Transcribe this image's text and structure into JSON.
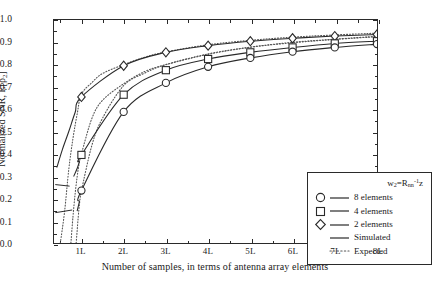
{
  "chart_data": {
    "type": "line",
    "title": "",
    "xlabel": "Number of samples, in terms of antenna array elements",
    "ylabel": "Normalized SNR, E[ρ₂]",
    "xlim": [
      0.35,
      8.0
    ],
    "ylim": [
      0.0,
      1.0
    ],
    "grid": false,
    "legend_position": "bottom-right",
    "x_tick_labels": [
      "1L",
      "2L",
      "3L",
      "4L",
      "5L",
      "6L",
      "7L",
      "8L"
    ],
    "x_tick_values": [
      1,
      2,
      3,
      4,
      5,
      6,
      7,
      8
    ],
    "y_tick_labels": [
      "0.0",
      "0.1",
      "0.2",
      "0.3",
      "0.4",
      "0.5",
      "0.6",
      "0.7",
      "0.8",
      "0.9",
      "1.0"
    ],
    "y_tick_values": [
      0.0,
      0.1,
      0.2,
      0.3,
      0.4,
      0.5,
      0.6,
      0.7,
      0.8,
      0.9,
      1.0
    ],
    "x": [
      1,
      2,
      3,
      4,
      5,
      6,
      7,
      8
    ],
    "series": [
      {
        "name": "2 elements",
        "marker": "diamond",
        "linestyle": "solid",
        "values": [
          0.655,
          0.795,
          0.855,
          0.885,
          0.905,
          0.918,
          0.928,
          0.935
        ]
      },
      {
        "name": "4 elements",
        "marker": "square",
        "linestyle": "solid",
        "values": [
          0.395,
          0.665,
          0.775,
          0.825,
          0.855,
          0.877,
          0.895,
          0.905
        ]
      },
      {
        "name": "8 elements",
        "marker": "circle",
        "linestyle": "solid",
        "values": [
          0.235,
          0.588,
          0.718,
          0.79,
          0.83,
          0.858,
          0.877,
          0.892
        ]
      }
    ],
    "expected_series": [
      {
        "name": "2 elements expected",
        "linestyle": "dotted",
        "x": [
          0.5,
          0.6,
          0.7,
          0.8,
          0.9,
          1.0,
          1.25,
          1.5,
          2.0,
          2.5,
          3.0,
          4.0,
          5.0,
          6.0,
          7.0,
          8.0
        ],
        "values": [
          0.0,
          0.14,
          0.33,
          0.47,
          0.58,
          0.667,
          0.72,
          0.76,
          0.8,
          0.833,
          0.857,
          0.889,
          0.909,
          0.923,
          0.933,
          0.941
        ]
      },
      {
        "name": "4 elements expected",
        "linestyle": "dotted",
        "x": [
          0.75,
          0.8,
          0.85,
          0.9,
          0.95,
          1.0,
          1.25,
          1.5,
          2.0,
          2.5,
          3.0,
          4.0,
          5.0,
          6.0,
          7.0,
          8.0
        ],
        "values": [
          0.0,
          0.12,
          0.22,
          0.3,
          0.36,
          0.4,
          0.56,
          0.64,
          0.714,
          0.769,
          0.8,
          0.846,
          0.878,
          0.9,
          0.914,
          0.927
        ]
      },
      {
        "name": "8 elements expected",
        "linestyle": "dotted",
        "x": [
          0.875,
          0.9,
          0.925,
          0.95,
          0.975,
          1.0,
          1.25,
          1.5,
          2.0,
          2.5,
          3.0,
          4.0,
          5.0,
          6.0,
          7.0,
          8.0
        ],
        "values": [
          0.0,
          0.06,
          0.12,
          0.17,
          0.21,
          0.235,
          0.44,
          0.56,
          0.706,
          0.762,
          0.8,
          0.848,
          0.878,
          0.898,
          0.913,
          0.925
        ]
      }
    ],
    "annotations": [
      {
        "note": "short horizontal artifact segment at left edge",
        "x0": 0.38,
        "x1": 0.72,
        "y0": 0.262,
        "y1": 0.255
      },
      {
        "note": "short horizontal artifact segment at left edge lower",
        "x0": 0.38,
        "x1": 0.78,
        "y0": 0.136,
        "y1": 0.148
      }
    ]
  },
  "legend": {
    "title": "w₂=Rₙₙ⁻¹z",
    "title_parts": {
      "w": "w",
      "w_sub": "2",
      "eq": "=R",
      "r_sub": "nn",
      "exp": "-1",
      "z": "z"
    },
    "entries": [
      {
        "marker": "circle",
        "label": "8 elements"
      },
      {
        "marker": "square",
        "label": "4 elements"
      },
      {
        "marker": "diamond",
        "label": "2 elements"
      },
      {
        "marker": "none",
        "label": "Simulated",
        "linestyle": "solid"
      },
      {
        "marker": "none",
        "label": "Expected",
        "linestyle": "dotted"
      }
    ]
  },
  "axes": {
    "y_title_prefix": "Normalized SNR, E[",
    "y_title_rho": "ρ",
    "y_title_sub": "2",
    "y_title_suffix": "]",
    "x_title": "Number of samples, in terms of antenna array elements"
  },
  "colors": {
    "line": "#2a2a2a",
    "axis": "#2a2a2a",
    "background": "#ffffff",
    "marker_fill": "#ffffff",
    "dotted": "#555555"
  }
}
